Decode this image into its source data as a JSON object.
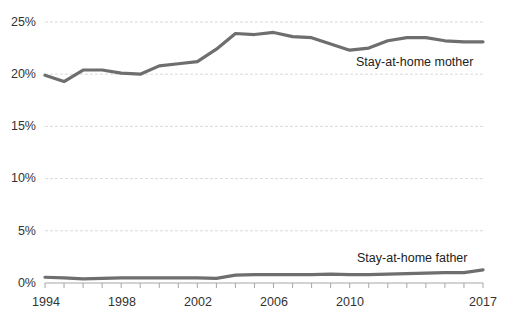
{
  "chart_data": {
    "type": "line",
    "title": "",
    "subtitle": "",
    "xlabel": "",
    "ylabel": "",
    "grid": true,
    "legend_position": "inline-annotation",
    "x": [
      1994,
      1995,
      1996,
      1997,
      1998,
      1999,
      2000,
      2001,
      2002,
      2003,
      2004,
      2005,
      2006,
      2007,
      2008,
      2009,
      2010,
      2011,
      2012,
      2013,
      2014,
      2015,
      2016,
      2017
    ],
    "xlim": [
      1994,
      2017
    ],
    "ylim": [
      0,
      25
    ],
    "y_ticks": [
      0,
      5,
      10,
      15,
      20,
      25
    ],
    "y_tick_labels": [
      "0%",
      "5%",
      "10%",
      "15%",
      "20%",
      "25%"
    ],
    "x_tick_labels": [
      "1994",
      "1998",
      "2002",
      "2006",
      "2010",
      "2017"
    ],
    "x_tick_label_values": [
      1994,
      1998,
      2002,
      2006,
      2010,
      2017
    ],
    "series": [
      {
        "name": "Stay-at-home mother",
        "label": "Stay-at-home mother",
        "color": "#6E6E6E",
        "values": [
          19.9,
          19.3,
          20.4,
          20.4,
          20.1,
          20.0,
          20.8,
          21.0,
          21.2,
          22.4,
          23.9,
          23.8,
          24.0,
          23.6,
          23.5,
          22.9,
          22.3,
          22.5,
          23.2,
          23.5,
          23.5,
          23.2,
          23.1,
          23.1
        ]
      },
      {
        "name": "Stay-at-home father",
        "label": "Stay-at-home father",
        "color": "#6E6E6E",
        "values": [
          0.55,
          0.5,
          0.4,
          0.45,
          0.5,
          0.5,
          0.5,
          0.5,
          0.5,
          0.45,
          0.75,
          0.8,
          0.8,
          0.8,
          0.8,
          0.85,
          0.8,
          0.8,
          0.85,
          0.9,
          0.95,
          1.0,
          1.0,
          1.25
        ]
      }
    ],
    "annotations": [
      {
        "text": "Stay-at-home mother",
        "x_px": 356,
        "y_px": 55
      },
      {
        "text": "Stay-at-home father",
        "x_px": 357,
        "y_px": 251
      }
    ]
  },
  "axes": {
    "grid_color": "#d9d9d9",
    "axis_color": "#a6a6a6",
    "tick_color": "#a6a6a6",
    "label_color": "#333333",
    "plot_left_px": 45,
    "plot_right_px": 483,
    "plot_top_px": 22,
    "plot_bottom_px": 283
  }
}
